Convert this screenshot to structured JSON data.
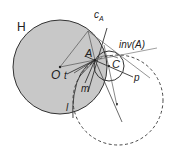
{
  "diagram": {
    "title": "",
    "colors": {
      "circle_fill": "#c8c8c8",
      "stroke": "#333333",
      "light_line": "#777777"
    },
    "labels": {
      "H": "H",
      "cA_main": "c",
      "cA_sub": "A",
      "A": "A",
      "invA": "inv(A)",
      "C": "C",
      "O": "O",
      "t": "t",
      "m": "m",
      "p": "p",
      "l": "l"
    },
    "shapes": {
      "circle_H": {
        "cx": 60,
        "cy": 67,
        "r": 47,
        "style": "filled gray"
      },
      "circle_C": {
        "cx": 109,
        "cy": 66,
        "r": 15,
        "style": "solid"
      },
      "circle_dashed": {
        "cx": 118,
        "cy": 100,
        "r": 45,
        "style": "dashed"
      }
    }
  }
}
